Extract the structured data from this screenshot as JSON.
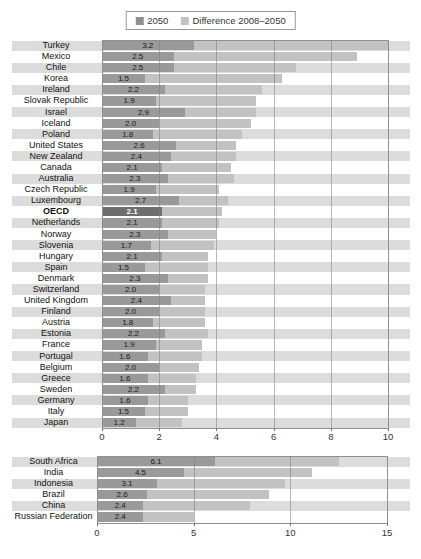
{
  "legend": {
    "items": [
      {
        "label": "2050",
        "color": "#8f8f8f",
        "name": "legend-swatch-2050"
      },
      {
        "label": "Difference 2008–2050",
        "color": "#c2c2c2",
        "name": "legend-swatch-difference"
      }
    ]
  },
  "colors": {
    "bar_2050": "#999999",
    "bar_2050_oecd": "#6e6e6e",
    "bar_difference": "#c2c2c2",
    "row_band": "#dcdcdc",
    "value_text": "#1a1a1a",
    "value_text_oecd": "#ffffff",
    "grid": "#7d7d7d",
    "border": "#8f8f8f",
    "axis_text": "#333333"
  },
  "chart_data": [
    {
      "type": "bar",
      "orientation": "horizontal-stacked",
      "series": [
        "2050",
        "Difference 2008–2050"
      ],
      "note": "bar label shows the 2050 value; light segment extends to the 2008 value",
      "xlim": [
        0,
        10
      ],
      "xticks": [
        0,
        2,
        4,
        6,
        8,
        10
      ],
      "grid": "vertical",
      "rows": [
        {
          "label": "Turkey",
          "value_2050": "3.2",
          "total_2008": 10.0
        },
        {
          "label": "Mexico",
          "value_2050": "2.5",
          "total_2008": 8.9
        },
        {
          "label": "Chile",
          "value_2050": "2.5",
          "total_2008": 6.8
        },
        {
          "label": "Korea",
          "value_2050": "1.5",
          "total_2008": 6.3
        },
        {
          "label": "Ireland",
          "value_2050": "2.2",
          "total_2008": 5.6
        },
        {
          "label": "Slovak Republic",
          "value_2050": "1.9",
          "total_2008": 5.4
        },
        {
          "label": "Israel",
          "value_2050": "2.9",
          "total_2008": 5.4
        },
        {
          "label": "Iceland",
          "value_2050": "2.0",
          "total_2008": 5.2
        },
        {
          "label": "Poland",
          "value_2050": "1.8",
          "total_2008": 4.9
        },
        {
          "label": "United States",
          "value_2050": "2.6",
          "total_2008": 4.7
        },
        {
          "label": "New Zealand",
          "value_2050": "2.4",
          "total_2008": 4.7
        },
        {
          "label": "Canada",
          "value_2050": "2.1",
          "total_2008": 4.5
        },
        {
          "label": "Australia",
          "value_2050": "2.3",
          "total_2008": 4.6
        },
        {
          "label": "Czech Republic",
          "value_2050": "1.9",
          "total_2008": 4.1
        },
        {
          "label": "Luxembourg",
          "value_2050": "2.7",
          "total_2008": 4.4
        },
        {
          "label": "OECD",
          "value_2050": "2.1",
          "total_2008": 4.2,
          "emphasis": true
        },
        {
          "label": "Netherlands",
          "value_2050": "2.1",
          "total_2008": 4.1
        },
        {
          "label": "Norway",
          "value_2050": "2.3",
          "total_2008": 4.0
        },
        {
          "label": "Slovenia",
          "value_2050": "1.7",
          "total_2008": 3.9
        },
        {
          "label": "Hungary",
          "value_2050": "2.1",
          "total_2008": 3.7
        },
        {
          "label": "Spain",
          "value_2050": "1.5",
          "total_2008": 3.7
        },
        {
          "label": "Denmark",
          "value_2050": "2.3",
          "total_2008": 3.7
        },
        {
          "label": "Switzerland",
          "value_2050": "2.0",
          "total_2008": 3.6
        },
        {
          "label": "United Kingdom",
          "value_2050": "2.4",
          "total_2008": 3.6
        },
        {
          "label": "Finland",
          "value_2050": "2.0",
          "total_2008": 3.6
        },
        {
          "label": "Austria",
          "value_2050": "1.8",
          "total_2008": 3.6
        },
        {
          "label": "Estonia",
          "value_2050": "2.2",
          "total_2008": 3.7
        },
        {
          "label": "France",
          "value_2050": "1.9",
          "total_2008": 3.5
        },
        {
          "label": "Portugal",
          "value_2050": "1.6",
          "total_2008": 3.5
        },
        {
          "label": "Belgium",
          "value_2050": "2.0",
          "total_2008": 3.4
        },
        {
          "label": "Greece",
          "value_2050": "1.6",
          "total_2008": 3.3
        },
        {
          "label": "Sweden",
          "value_2050": "2.2",
          "total_2008": 3.3
        },
        {
          "label": "Germany",
          "value_2050": "1.6",
          "total_2008": 3.0
        },
        {
          "label": "Italy",
          "value_2050": "1.5",
          "total_2008": 3.0
        },
        {
          "label": "Japan",
          "value_2050": "1.2",
          "total_2008": 2.8
        }
      ]
    },
    {
      "type": "bar",
      "orientation": "horizontal-stacked",
      "series": [
        "2050",
        "Difference 2008–2050"
      ],
      "xlim": [
        0,
        15
      ],
      "xticks": [
        0,
        5,
        10,
        15
      ],
      "grid": "vertical",
      "rows": [
        {
          "label": "South Africa",
          "value_2050": "6.1",
          "total_2008": 12.5
        },
        {
          "label": "India",
          "value_2050": "4.5",
          "total_2008": 11.1
        },
        {
          "label": "Indonesia",
          "value_2050": "3.1",
          "total_2008": 9.7
        },
        {
          "label": "Brazil",
          "value_2050": "2.6",
          "total_2008": 8.9
        },
        {
          "label": "China",
          "value_2050": "2.4",
          "total_2008": 7.9
        },
        {
          "label": "Russian Federation",
          "value_2050": "2.4",
          "total_2008": 5.0
        }
      ]
    }
  ]
}
